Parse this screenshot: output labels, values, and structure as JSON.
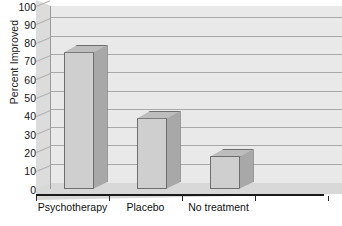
{
  "chart_data": {
    "type": "bar",
    "title": "",
    "xlabel": "",
    "ylabel": "Percent Improved",
    "categories": [
      "Psychotherapy",
      "Placebo",
      "No treatment",
      ""
    ],
    "values": [
      75,
      39,
      18,
      null
    ],
    "ylim": [
      0,
      100
    ],
    "y_ticks": [
      0,
      10,
      20,
      30,
      40,
      50,
      60,
      70,
      80,
      90,
      100
    ],
    "y_tick_labels": [
      "0",
      "10",
      "20",
      "30",
      "40",
      "50",
      "60",
      "70",
      "80",
      "90",
      "100"
    ],
    "grid": true,
    "grid_axis": "y",
    "legend": false,
    "legend_position": "none",
    "style": "3d-bar",
    "series": [
      {
        "name": "Percent Improved",
        "values": [
          75,
          39,
          18,
          null
        ]
      }
    ],
    "colors": {
      "bar_front": "#cfcfcf",
      "bar_top": "#bdbdbd",
      "bar_side": "#a8a8a8",
      "bar_edge": "#6e6e6e",
      "back_wall": "#e9e9e9",
      "left_wall": "#dcdcdc",
      "floor": "#d8d8d8",
      "gridline": "#a9a9a9",
      "axis": "#1a1a1a",
      "text": "#111111"
    }
  }
}
